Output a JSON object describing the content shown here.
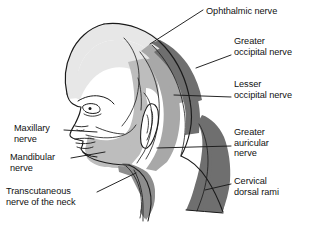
{
  "figure": {
    "view": "left lateral profile of head and neck",
    "background_color": "#ffffff",
    "line_color": "#1a1a1a"
  },
  "labels": {
    "ophthalmic": "Ophthalmic nerve",
    "greater_occipital": "Greater\noccipital nerve",
    "lesser_occipital": "Lesser\noccipital nerve",
    "greater_auricular": "Greater\nauricular\nnerve",
    "cervical_dorsal_rami": "Cervical\ndorsal rami",
    "maxillary": "Maxillary\nnerve",
    "mandibular": "Mandibular\nnerve",
    "transcutaneous": "Transcutaneous\nnerve of the neck"
  },
  "regions": [
    {
      "key": "ophthalmic",
      "name": "ophthalmic-nerve-region",
      "label": "Ophthalmic nerve",
      "fill": "#e7e7e7",
      "description": "forehead, scalp vertex and upper face"
    },
    {
      "key": "maxillary",
      "name": "maxillary-nerve-region",
      "label": "Maxillary nerve",
      "fill": "#ffffff",
      "description": "midface, cheek and temple"
    },
    {
      "key": "mandibular",
      "name": "mandibular-nerve-region",
      "label": "Mandibular nerve",
      "fill": "#bdbdbd",
      "description": "lower jaw, chin and preauricular temple"
    },
    {
      "key": "lesser_occipital",
      "name": "lesser-occipital-nerve-region",
      "label": "Lesser occipital nerve",
      "fill": "#a8a8a8",
      "description": "band behind and above the ear"
    },
    {
      "key": "greater_occipital",
      "name": "greater-occipital-nerve-region",
      "label": "Greater occipital nerve",
      "fill": "#6f6f6f",
      "description": "posterior scalp over the occiput"
    },
    {
      "key": "greater_auricular",
      "name": "greater-auricular-nerve-region",
      "label": "Greater auricular nerve",
      "fill": "#ffffff",
      "description": "region over and below the ear, angle of jaw"
    },
    {
      "key": "cervical_dorsal_rami",
      "name": "cervical-dorsal-rami-region",
      "label": "Cervical dorsal rami",
      "fill": "#6f6f6f",
      "description": "posterior neck strip"
    },
    {
      "key": "transcutaneous",
      "name": "transcutaneous-nerve-region",
      "label": "Transcutaneous nerve of the neck",
      "fill": "#8d8d8d",
      "description": "anterior neck wedge below the jaw"
    }
  ],
  "colors": {
    "light_gray": "#e7e7e7",
    "mid_light_gray": "#bdbdbd",
    "mid_gray": "#a8a8a8",
    "dark_gray": "#6f6f6f",
    "neck_gray": "#8d8d8d",
    "outline": "#1a1a1a",
    "white": "#ffffff"
  }
}
